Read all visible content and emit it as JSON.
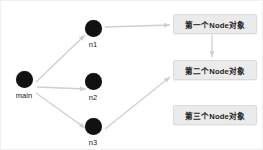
{
  "diagram": {
    "colors": {
      "background": "#ffffff",
      "node_fill": "#111111",
      "box_fill": "#ebebeb",
      "box_border": "#dcdcdc",
      "edge": "#cfcfcf",
      "text": "#1d1d1d"
    },
    "nodes": [
      {
        "id": "main",
        "label": "main",
        "x": 23,
        "y": 78
      },
      {
        "id": "n1",
        "label": "n1",
        "x": 92,
        "y": 27
      },
      {
        "id": "n2",
        "label": "n2",
        "x": 92,
        "y": 80
      },
      {
        "id": "n3",
        "label": "n3",
        "x": 92,
        "y": 125
      }
    ],
    "boxes": [
      {
        "id": "box1",
        "label": "第一个Node对象",
        "x": 172,
        "y": 13,
        "w": 84,
        "h": 20
      },
      {
        "id": "box2",
        "label": "第二个Node对象",
        "x": 172,
        "y": 59,
        "w": 84,
        "h": 20
      },
      {
        "id": "box3",
        "label": "第三个Node对象",
        "x": 172,
        "y": 104,
        "w": 84,
        "h": 20
      }
    ],
    "edges": [
      {
        "id": "main-to-n1",
        "from": "main",
        "to": "n1"
      },
      {
        "id": "main-to-n2",
        "from": "main",
        "to": "n2"
      },
      {
        "id": "main-to-n3",
        "from": "main",
        "to": "n3"
      },
      {
        "id": "n1-to-box1",
        "from": "n1",
        "to": "box1"
      },
      {
        "id": "n3-to-box2",
        "from": "n3",
        "to": "box2"
      },
      {
        "id": "box1-to-box2",
        "from": "box1",
        "to": "box2"
      }
    ]
  }
}
